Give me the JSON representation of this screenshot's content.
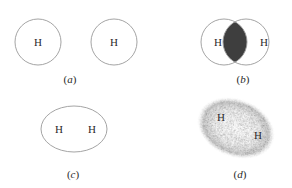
{
  "figure": {
    "panels": [
      {
        "id": "a",
        "caption_open": "(",
        "caption_letter": "a",
        "caption_close": ")",
        "atoms": [
          "H",
          "H"
        ],
        "description": "two separate hydrogen atoms"
      },
      {
        "id": "b",
        "caption_open": "(",
        "caption_letter": "b",
        "caption_close": ")",
        "atoms": [
          "H",
          "H"
        ],
        "description": "overlapping atomic orbitals with shaded overlap region"
      },
      {
        "id": "c",
        "caption_open": "(",
        "caption_letter": "c",
        "caption_close": ")",
        "atoms": [
          "H",
          "H"
        ],
        "description": "single elliptical molecular orbital enclosing both atoms"
      },
      {
        "id": "d",
        "caption_open": "(",
        "caption_letter": "d",
        "caption_close": ")",
        "atoms": [
          "H",
          "H"
        ],
        "description": "electron cloud density of H2 molecule"
      }
    ],
    "colors": {
      "outline": "#9a9a9a",
      "overlap_fill": "#3e3e3e",
      "text": "#2a2a2a",
      "cloud": "#b0b0b0"
    }
  }
}
